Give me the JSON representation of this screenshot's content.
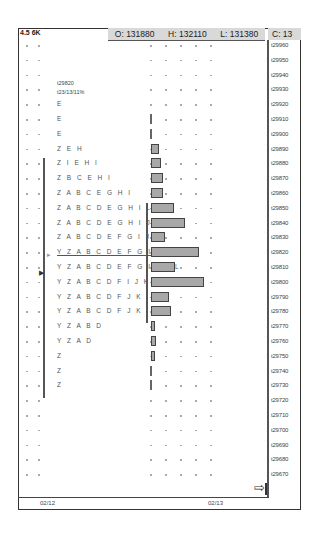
{
  "header": {
    "left_label": "4.5 6K",
    "open": "O: 131880",
    "high": "H: 132110",
    "low": "L: 131380",
    "close": "C: 13"
  },
  "profile_label": {
    "line1": "t29820",
    "line2": "t23/13/11%"
  },
  "dates": [
    "02/12",
    "02/13"
  ],
  "chart_data": {
    "type": "bar",
    "orientation": "horizontal",
    "ylabel": "Price",
    "price_levels": [
      "t29960",
      "t29950",
      "t29940",
      "t29930",
      "t29920",
      "t29910",
      "t29900",
      "t29890",
      "t29880",
      "t29870",
      "t29860",
      "t29850",
      "t29840",
      "t29830",
      "t29820",
      "t29810",
      "t29800",
      "t29790",
      "t29780",
      "t29770",
      "t29760",
      "t29750",
      "t29740",
      "t29730",
      "t29720",
      "t29710",
      "t29700",
      "t29690",
      "t29680",
      "t29670"
    ],
    "tpo_letters": {
      "t29920": "E",
      "t29910": "E",
      "t29900": "E",
      "t29890": "Z E H",
      "t29880": "Z I E H I",
      "t29870": "Z B C E H I",
      "t29860": "Z A B C E G H I",
      "t29850": "Z A B C D E G H I L",
      "t29840": "Z A B C D E G H I J L",
      "t29830": "Z A B C D E F G I J L",
      "t29820": "Y Z A B C D E F G I J K L",
      "t29810": "Y Z A B C D E F G I J K L",
      "t29800": "Y Z A B C D F I J K",
      "t29790": "Y Z A B C D F J K",
      "t29780": "Y Z A B C D F J K",
      "t29770": "Y Z A B D",
      "t29760": "Y Z A D",
      "t29750": "Z",
      "t29740": "Z",
      "t29730": "Z"
    },
    "volume_bars": {
      "t29910": 1,
      "t29900": 1,
      "t29890": 8,
      "t29880": 10,
      "t29870": 12,
      "t29860": 12,
      "t29850": 23,
      "t29840": 34,
      "t29830": 14,
      "t29820": 48,
      "t29810": 24,
      "t29800": 53,
      "t29790": 18,
      "t29780": 20,
      "t29770": 4,
      "t29760": 5,
      "t29750": 4,
      "t29740": 1,
      "t29730": 1
    },
    "poc": "t29820",
    "dates": [
      "02/12",
      "02/13"
    ]
  },
  "icons": {
    "scroll_right": "arrow-right-to-bar-icon"
  }
}
